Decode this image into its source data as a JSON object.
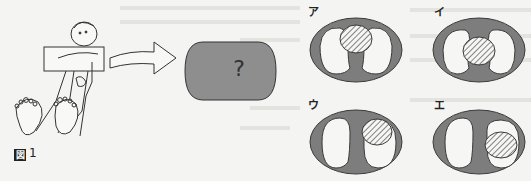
{
  "figure": {
    "label_prefix": "図",
    "label_number": "1"
  },
  "question_shape": {
    "symbol": "?",
    "fill": "#8e8e8e"
  },
  "options": [
    {
      "label": "ア",
      "hatch_position": "top-center"
    },
    {
      "label": "イ",
      "hatch_position": "center"
    },
    {
      "label": "ウ",
      "hatch_position": "upper-right"
    },
    {
      "label": "エ",
      "hatch_position": "right"
    }
  ],
  "colors": {
    "background": "#f4f4f2",
    "ring": "#7d7d7d",
    "ring_stroke": "#3a3a3a",
    "hole": "#f6f6f4",
    "hatch_stroke": "#444444",
    "line": "#333333"
  }
}
